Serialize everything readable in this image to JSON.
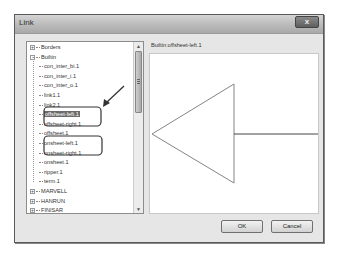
{
  "window": {
    "title": "Link",
    "close_label": "x"
  },
  "tree": {
    "nodes": [
      {
        "label": "Borders",
        "level": 0,
        "expander": "+"
      },
      {
        "label": "Builtin",
        "level": 0,
        "expander": "-"
      },
      {
        "label": "con_inter_bi.1",
        "level": 1
      },
      {
        "label": "con_inter_i.1",
        "level": 1
      },
      {
        "label": "con_inter_o.1",
        "level": 1
      },
      {
        "label": "link1.1",
        "level": 1
      },
      {
        "label": "link2.1",
        "level": 1
      },
      {
        "label": "offsheet-left.1",
        "level": 1,
        "selected": true
      },
      {
        "label": "offsheet-right.1",
        "level": 1
      },
      {
        "label": "offsheet.1",
        "level": 1
      },
      {
        "label": "onsheet-left.1",
        "level": 1
      },
      {
        "label": "onsheet-right.1",
        "level": 1
      },
      {
        "label": "onsheet.1",
        "level": 1
      },
      {
        "label": "ripper.1",
        "level": 1
      },
      {
        "label": "term.1",
        "level": 1
      },
      {
        "label": "MARVELL",
        "level": 0,
        "expander": "+"
      },
      {
        "label": "HANRUN",
        "level": 0,
        "expander": "+"
      },
      {
        "label": "FINISAR",
        "level": 0,
        "expander": "+"
      }
    ],
    "scroll_up": "▲",
    "scroll_down": "▼"
  },
  "preview": {
    "label": "Builtin:offsheet-left.1",
    "symbol": "offsheet-left-triangle"
  },
  "buttons": {
    "ok": "OK",
    "cancel": "Cancel"
  },
  "annotations": {
    "highlight_groups": [
      [
        "offsheet-left.1",
        "offsheet-right.1"
      ],
      [
        "onsheet-left.1",
        "onsheet-right.1"
      ]
    ],
    "arrow_target": "offsheet-left.1",
    "stroke_color": "#333333"
  },
  "colors": {
    "selection_bg": "#6b6b6b",
    "dialog_bg": "#e6e6e6",
    "titlebar": "#b8b8b8"
  }
}
